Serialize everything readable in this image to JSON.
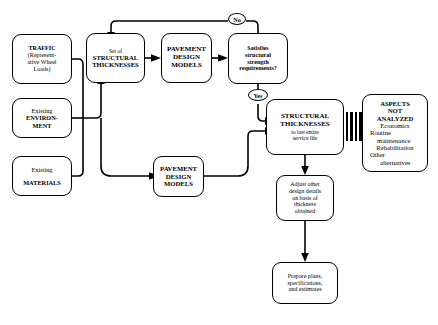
{
  "diagram": {
    "ink_color": "#000000",
    "background_color": "#ffffff"
  },
  "nodes": {
    "traffic": {
      "lines": [
        "TRAFFIC",
        "(Represent-",
        "ative Wheel",
        "Loads)"
      ]
    },
    "environment": {
      "lines": [
        "Existing",
        "ENVIRON-",
        "MENT"
      ]
    },
    "materials": {
      "lines": [
        "Existing",
        "MATERIALS"
      ]
    },
    "set_thicknesses": {
      "lines": [
        "Set of",
        "STRUCTURAL",
        "THICKNESSES"
      ]
    },
    "models_top": {
      "lines": [
        "PAVEMENT",
        "DESIGN",
        "MODELS"
      ]
    },
    "decision": {
      "lines": [
        "Satisfies",
        "structural",
        "strength",
        "requirements?"
      ]
    },
    "models_bottom": {
      "lines": [
        "PAVEMENT",
        "DESIGN",
        "MODELS"
      ]
    },
    "final_thickness": {
      "lines": [
        "STRUCTURAL",
        "THICKNESSES"
      ],
      "sub": [
        "to last entire",
        "service life"
      ]
    },
    "aspects": {
      "heading": [
        "ASPECTS",
        "NOT",
        "ANALYZED"
      ],
      "items": [
        "Economics",
        "Routine",
        "maintenance",
        "Rehabilitation",
        "Other",
        "alternatives"
      ]
    },
    "adjust": {
      "lines": [
        "Adjust other",
        "design details",
        "on basis of",
        "thickness",
        "obtained"
      ]
    },
    "prepare": {
      "lines": [
        "Prepare plans,",
        "specifications,",
        "and estimates"
      ]
    }
  },
  "labels": {
    "no": "No",
    "yes": "Yes"
  }
}
